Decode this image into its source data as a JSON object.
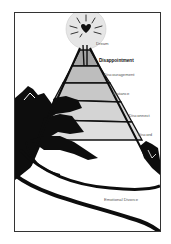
{
  "figure": {
    "top_symbol": "heart-in-sun",
    "colors": {
      "frame": "#333333",
      "sun": "#e6e6e6",
      "ink": "#0d0d0d",
      "band_light": "#d4d4d4",
      "band_mid": "#bdbdbd",
      "band_dark": "#a6a6a6",
      "label": "#555555"
    },
    "layers": [
      {
        "label": "Dream",
        "emphasis": false
      },
      {
        "label": "Disappointment",
        "emphasis": true
      },
      {
        "label": "Discouragement",
        "emphasis": false
      },
      {
        "label": "Distance",
        "emphasis": false
      },
      {
        "label": "Disconnect",
        "emphasis": false
      },
      {
        "label": "Discord",
        "emphasis": false
      },
      {
        "label": "Emotional Divorce",
        "emphasis": false
      }
    ]
  }
}
